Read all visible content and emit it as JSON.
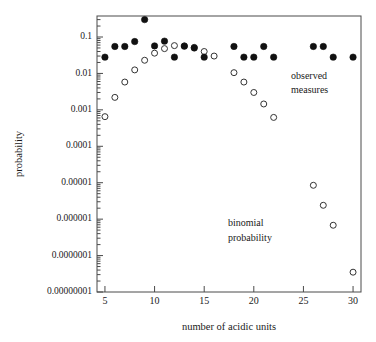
{
  "chart_data": {
    "type": "scatter",
    "title": "",
    "xlabel": "number of acidic units",
    "ylabel": "probability",
    "xlim": [
      4.2,
      30.8
    ],
    "ylim": [
      1e-08,
      0.4
    ],
    "yscale": "log",
    "xscale": "linear",
    "grid": false,
    "legend_position": "inline-annotations",
    "x_ticks": [
      5,
      10,
      15,
      20,
      25,
      30
    ],
    "x_tick_labels": [
      "5",
      "10",
      "15",
      "20",
      "25",
      "30"
    ],
    "y_ticks": [
      0.1,
      0.01,
      0.001,
      0.0001,
      1e-05,
      1e-06,
      1e-07,
      1e-08
    ],
    "y_tick_labels": [
      "0.1",
      "0.01",
      "0.001",
      "0.0001",
      "0.00001",
      "0.000001",
      "0.0000001",
      "0.00000001"
    ],
    "series": [
      {
        "name": "observed measures",
        "marker": "filled-circle",
        "color": "#111111",
        "points": [
          {
            "x": 5,
            "y": 0.028
          },
          {
            "x": 6,
            "y": 0.055
          },
          {
            "x": 7,
            "y": 0.055
          },
          {
            "x": 8,
            "y": 0.075
          },
          {
            "x": 9,
            "y": 0.3
          },
          {
            "x": 10,
            "y": 0.057
          },
          {
            "x": 11,
            "y": 0.077
          },
          {
            "x": 12,
            "y": 0.028
          },
          {
            "x": 13,
            "y": 0.056
          },
          {
            "x": 14,
            "y": 0.05
          },
          {
            "x": 15,
            "y": 0.028
          },
          {
            "x": 18,
            "y": 0.055
          },
          {
            "x": 19,
            "y": 0.028
          },
          {
            "x": 20,
            "y": 0.028
          },
          {
            "x": 21,
            "y": 0.055
          },
          {
            "x": 22,
            "y": 0.028
          },
          {
            "x": 26,
            "y": 0.055
          },
          {
            "x": 27,
            "y": 0.055
          },
          {
            "x": 28,
            "y": 0.028
          },
          {
            "x": 30,
            "y": 0.028
          }
        ]
      },
      {
        "name": "binomial probability",
        "marker": "open-circle",
        "color": "#333333",
        "points": [
          {
            "x": 5,
            "y": 0.00065
          },
          {
            "x": 6,
            "y": 0.0022
          },
          {
            "x": 7,
            "y": 0.0058
          },
          {
            "x": 8,
            "y": 0.0125
          },
          {
            "x": 9,
            "y": 0.023
          },
          {
            "x": 10,
            "y": 0.036
          },
          {
            "x": 11,
            "y": 0.048
          },
          {
            "x": 12,
            "y": 0.058
          },
          {
            "x": 13,
            "y": 0.057
          },
          {
            "x": 14,
            "y": 0.052
          },
          {
            "x": 15,
            "y": 0.04
          },
          {
            "x": 16,
            "y": 0.03
          },
          {
            "x": 18,
            "y": 0.0105
          },
          {
            "x": 19,
            "y": 0.0058
          },
          {
            "x": 20,
            "y": 0.003
          },
          {
            "x": 21,
            "y": 0.00145
          },
          {
            "x": 22,
            "y": 0.00062
          },
          {
            "x": 26,
            "y": 8.5e-06
          },
          {
            "x": 27,
            "y": 2.4e-06
          },
          {
            "x": 28,
            "y": 6.8e-07
          },
          {
            "x": 30,
            "y": 3.5e-08
          }
        ]
      }
    ],
    "annotations": [
      {
        "text": "observed",
        "x_px": 291,
        "y_px": 79
      },
      {
        "text": "measures",
        "x_px": 291,
        "y_px": 93
      },
      {
        "text": "binomial",
        "x_px": 228,
        "y_px": 226
      },
      {
        "text": "probability",
        "x_px": 228,
        "y_px": 241
      }
    ]
  },
  "axes": {
    "x_title": "number of acidic units",
    "y_title": "probability"
  }
}
